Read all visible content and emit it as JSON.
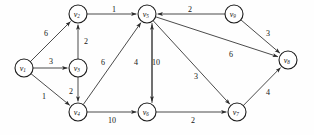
{
  "figure": {
    "name": "weighted-directed-graph",
    "background": "#fefefe",
    "stroke_color": "#2b2b2b",
    "node_fill": "#ffffff",
    "node_stroke": "#1c1c1c",
    "width": 314,
    "height": 135
  },
  "chart_data": {
    "type": "diagram",
    "diagram_type": "weighted-directed-graph",
    "title": "",
    "directed": true,
    "weighted": true,
    "node_radius": 9,
    "nodes": [
      {
        "id": "v1",
        "label": "v",
        "sub": "1",
        "x": 24,
        "y": 68
      },
      {
        "id": "v2",
        "label": "v",
        "sub": "2",
        "x": 78,
        "y": 14
      },
      {
        "id": "v3",
        "label": "v",
        "sub": "3",
        "x": 78,
        "y": 68
      },
      {
        "id": "v4",
        "label": "v",
        "sub": "4",
        "x": 78,
        "y": 112
      },
      {
        "id": "v5",
        "label": "v",
        "sub": "5",
        "x": 147,
        "y": 14
      },
      {
        "id": "v6",
        "label": "v",
        "sub": "6",
        "x": 147,
        "y": 112
      },
      {
        "id": "v7",
        "label": "v",
        "sub": "7",
        "x": 237,
        "y": 112
      },
      {
        "id": "v8",
        "label": "v",
        "sub": "8",
        "x": 288,
        "y": 60
      },
      {
        "id": "v9",
        "label": "v",
        "sub": "9",
        "x": 234,
        "y": 14
      }
    ],
    "edges": [
      {
        "from": "v1",
        "to": "v2",
        "weight": 6,
        "lx": 46,
        "ly": 33
      },
      {
        "from": "v1",
        "to": "v3",
        "weight": 3,
        "lx": 51,
        "ly": 61
      },
      {
        "from": "v1",
        "to": "v4",
        "weight": 1,
        "lx": 44,
        "ly": 96
      },
      {
        "from": "v3",
        "to": "v2",
        "weight": 2,
        "lx": 86,
        "ly": 41
      },
      {
        "from": "v3",
        "to": "v4",
        "weight": 2,
        "lx": 71,
        "ly": 91
      },
      {
        "from": "v2",
        "to": "v5",
        "weight": 1,
        "lx": 114,
        "ly": 9
      },
      {
        "from": "v4",
        "to": "v5",
        "weight": 6,
        "lx": 103,
        "ly": 62
      },
      {
        "from": "v4",
        "to": "v6",
        "weight": 10,
        "lx": 112,
        "ly": 120
      },
      {
        "from": "v5",
        "to": "v6",
        "weight": 4,
        "lx": 136,
        "ly": 62
      },
      {
        "from": "v6",
        "to": "v5",
        "weight": 10,
        "lx": 156,
        "ly": 62
      },
      {
        "from": "v5",
        "to": "v7",
        "weight": 3,
        "lx": 196,
        "ly": 76
      },
      {
        "from": "v6",
        "to": "v7",
        "weight": 2,
        "lx": 193,
        "ly": 120
      },
      {
        "from": "v9",
        "to": "v5",
        "weight": 2,
        "lx": 190,
        "ly": 9
      },
      {
        "from": "v9",
        "to": "v8",
        "weight": 3,
        "lx": 268,
        "ly": 33
      },
      {
        "from": "v5",
        "to": "v8",
        "weight": 6,
        "lx": 231,
        "ly": 54
      },
      {
        "from": "v7",
        "to": "v8",
        "weight": 4,
        "lx": 268,
        "ly": 92
      }
    ]
  }
}
